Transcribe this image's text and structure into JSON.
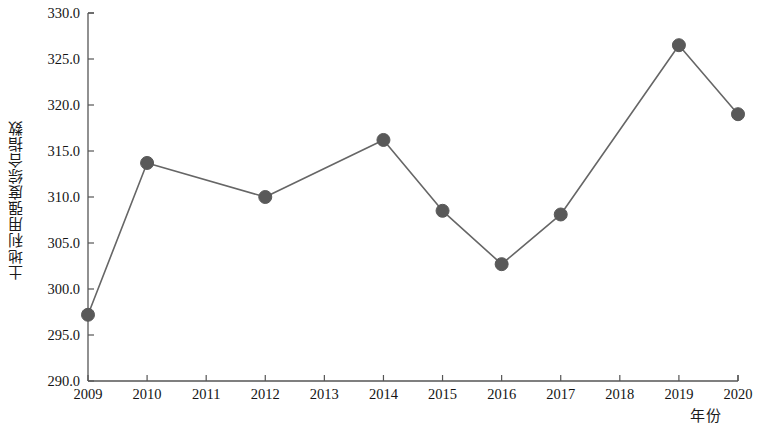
{
  "chart_data": {
    "type": "line",
    "title": "",
    "xlabel": "年份",
    "ylabel": "土地利用强度综合指数",
    "x": [
      2009,
      2010,
      2011,
      2012,
      2013,
      2014,
      2015,
      2016,
      2017,
      2018,
      2019,
      2020
    ],
    "categories": [
      "2009",
      "2010",
      "2011",
      "2012",
      "2013",
      "2014",
      "2015",
      "2016",
      "2017",
      "2018",
      "2019",
      "2020"
    ],
    "values": [
      297.2,
      313.7,
      null,
      310.0,
      null,
      316.2,
      308.5,
      302.7,
      308.1,
      null,
      326.5,
      319.0
    ],
    "series": [
      {
        "name": "土地利用强度综合指数",
        "values": [
          297.2,
          313.7,
          null,
          310.0,
          null,
          316.2,
          308.5,
          302.7,
          308.1,
          null,
          326.5,
          319.0
        ]
      }
    ],
    "marker_years": [
      2009,
      2010,
      2012,
      2014,
      2015,
      2016,
      2017,
      2019,
      2020
    ],
    "ylim": [
      290.0,
      330.0
    ],
    "xlim": [
      2009,
      2020
    ],
    "yticks": [
      "290.0",
      "295.0",
      "300.0",
      "305.0",
      "310.0",
      "315.0",
      "320.0",
      "325.0",
      "330.0"
    ],
    "ytick_values": [
      290.0,
      295.0,
      300.0,
      305.0,
      310.0,
      315.0,
      320.0,
      325.0,
      330.0
    ],
    "xticks": [
      "2009",
      "2010",
      "2011",
      "2012",
      "2013",
      "2014",
      "2015",
      "2016",
      "2017",
      "2018",
      "2019",
      "2020"
    ],
    "grid": false,
    "legend": null,
    "legend_position": "none",
    "line_color": "#666666",
    "marker_color": "#595959",
    "axis_color": "#555555"
  }
}
